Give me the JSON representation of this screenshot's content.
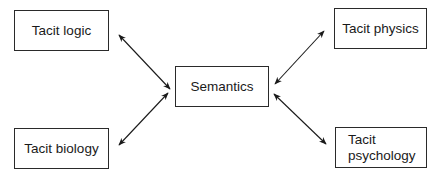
{
  "diagram": {
    "center": {
      "label": "Semantics"
    },
    "nodes": [
      {
        "id": "logic",
        "label": "Tacit logic",
        "position": "top-left"
      },
      {
        "id": "physics",
        "label": "Tacit physics",
        "position": "top-right"
      },
      {
        "id": "biology",
        "label": "Tacit biology",
        "position": "bottom-left"
      },
      {
        "id": "psychology",
        "label_line1": "Tacit",
        "label_line2": "psychology",
        "position": "bottom-right"
      }
    ],
    "edges": [
      {
        "from": "logic",
        "to": "semantics",
        "type": "bidirectional"
      },
      {
        "from": "physics",
        "to": "semantics",
        "type": "bidirectional"
      },
      {
        "from": "biology",
        "to": "semantics",
        "type": "bidirectional"
      },
      {
        "from": "psychology",
        "to": "semantics",
        "type": "bidirectional"
      }
    ],
    "colors": {
      "line": "#1a1a1a",
      "background": "#ffffff"
    }
  }
}
